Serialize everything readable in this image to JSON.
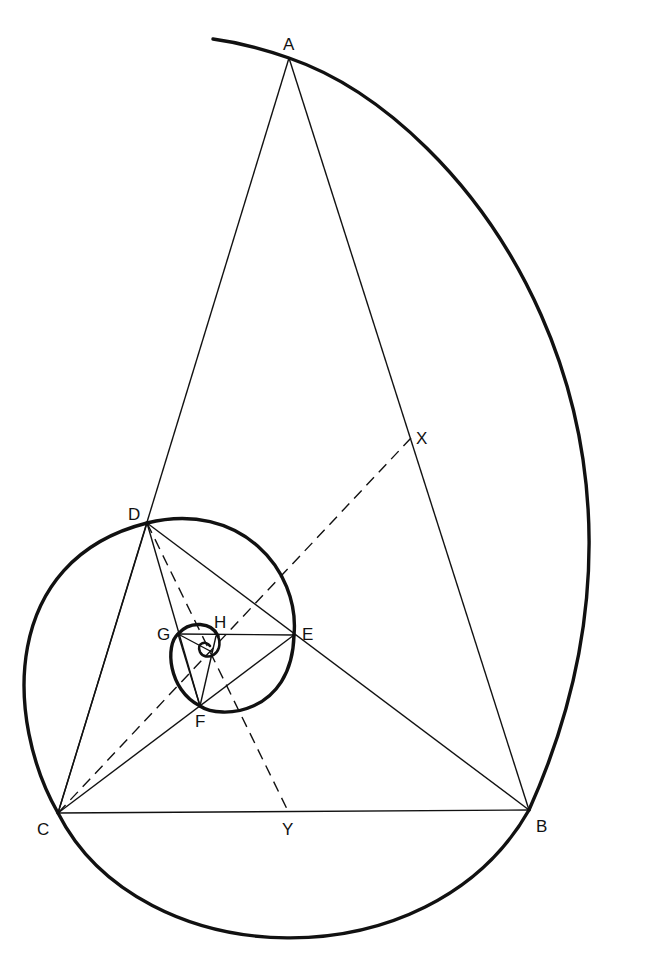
{
  "diagram": {
    "title": "",
    "colors": {
      "ink": "#111111",
      "background": "#ffffff"
    },
    "labels": {
      "A": "A",
      "B": "B",
      "C": "C",
      "D": "D",
      "E": "E",
      "F": "F",
      "G": "G",
      "H": "H",
      "X": "X",
      "Y": "Y"
    },
    "points": {
      "A": [
        289,
        58
      ],
      "B": [
        529,
        810
      ],
      "C": [
        58,
        813
      ],
      "D": [
        147,
        523
      ],
      "E": [
        294,
        635
      ],
      "F": [
        200,
        706
      ],
      "G": [
        178,
        634
      ],
      "H": [
        213,
        633
      ],
      "X": [
        411,
        438
      ],
      "Y": [
        288,
        811
      ],
      "O": [
        207,
        649
      ]
    },
    "solid_lines": [
      [
        "A",
        "B"
      ],
      [
        "A",
        "C"
      ],
      [
        "B",
        "C"
      ],
      [
        "D",
        "B"
      ],
      [
        "D",
        "C"
      ],
      [
        "C",
        "E"
      ],
      [
        "D",
        "E"
      ],
      [
        "D",
        "F"
      ],
      [
        "E",
        "F"
      ],
      [
        "E",
        "G"
      ],
      [
        "F",
        "G"
      ],
      [
        "G",
        "H"
      ],
      [
        "F",
        "H"
      ]
    ],
    "dashed_lines": [
      [
        "C",
        "X"
      ],
      [
        "D",
        "Y"
      ]
    ],
    "spiral": "logarithmic spiral passing through A, B, C, D, E, F, G, H converging at pole O"
  }
}
